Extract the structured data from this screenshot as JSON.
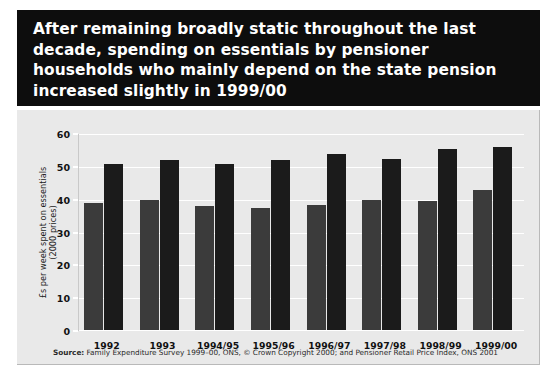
{
  "title": "After remaining broadly static throughout the last\ndecade, spending on essentials by pensioner\nhouseholds who mainly depend on the state pension\nincreased slightly in 1999/00",
  "source": {
    "prefix": "Source:",
    "text": "Family Expenditure Survey 1999–00, ONS, © Crown Copyright 2000; and Pensioner Retail Price Index, ONS 2001"
  },
  "colors": {
    "banner_background": "#0d0d0d",
    "banner_text": "#ffffff",
    "panel_background": "#e9e9e9",
    "gridline": "#ffffff",
    "series_mainly_dependent": "#3b3b3b",
    "series_private_income": "#1b1b1b",
    "page_background": "#ffffff"
  },
  "chart_data": {
    "type": "bar",
    "title": "After remaining broadly static throughout the last decade, spending on essentials by pensioner households who mainly depend on the state pension increased slightly in 1999/00",
    "xlabel": "",
    "ylabel": "£s per week spent on essentials\n(2000 prices)",
    "categories": [
      "1992",
      "1993",
      "1994/95",
      "1995/96",
      "1996/97",
      "1997/98",
      "1998/99",
      "1999/00"
    ],
    "series": [
      {
        "name": "Mainly dependent on the state retirement pension",
        "color": "#3b3b3b",
        "values": [
          39,
          40,
          38,
          37.5,
          38.5,
          40,
          39.5,
          43
        ]
      },
      {
        "name": "With private income",
        "color": "#1b1b1b",
        "values": [
          51,
          52,
          51,
          52,
          54,
          52.5,
          55.5,
          56
        ]
      }
    ],
    "ylim": [
      0,
      60
    ],
    "yticks": [
      0,
      10,
      20,
      30,
      40,
      50,
      60
    ],
    "ytick_labels": [
      "0",
      "10",
      "20",
      "30",
      "40",
      "50",
      "60"
    ],
    "grid": true,
    "legend_position": "top"
  }
}
